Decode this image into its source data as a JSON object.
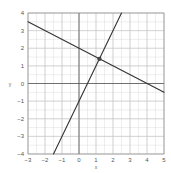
{
  "chart_data": {
    "type": "line",
    "title": "",
    "xlabel": "x",
    "ylabel": "y",
    "xlim": [
      -3,
      5
    ],
    "ylim": [
      -4,
      4
    ],
    "x_ticks": [
      -3,
      -2,
      -1,
      0,
      1,
      2,
      3,
      4,
      5
    ],
    "y_ticks": [
      -4,
      -3,
      -2,
      -1,
      0,
      1,
      2,
      3,
      4
    ],
    "x_tick_labels": [
      "−3",
      "−2",
      "−1",
      "0",
      "1",
      "2",
      "3",
      "4",
      "5"
    ],
    "y_tick_labels": [
      "−4",
      "−3",
      "−2",
      "−1",
      "0",
      "1",
      "2",
      "3",
      "4"
    ],
    "grid": true,
    "minor_grid_step": 0.5,
    "legend": null,
    "series": [
      {
        "name": "line-decreasing",
        "equation": "y = -0.5x + 2",
        "slope": -0.5,
        "intercept": 2,
        "x": [
          -3,
          5
        ],
        "y": [
          3.5,
          -0.5
        ],
        "color": "#333333"
      },
      {
        "name": "line-increasing",
        "equation": "y = 2x - 1",
        "slope": 2,
        "intercept": -1,
        "x": [
          -1.5,
          2.5
        ],
        "y": [
          -4,
          4
        ],
        "color": "#333333"
      }
    ],
    "annotations": [
      {
        "type": "point",
        "label": "intersection",
        "x": 1.2,
        "y": 1.4,
        "color": "#444444"
      }
    ]
  },
  "colors": {
    "background": "#ffffff",
    "grid_minor": "#dddddd",
    "grid_major": "#c4c4c4",
    "axis": "#555555",
    "frame": "#888888"
  }
}
